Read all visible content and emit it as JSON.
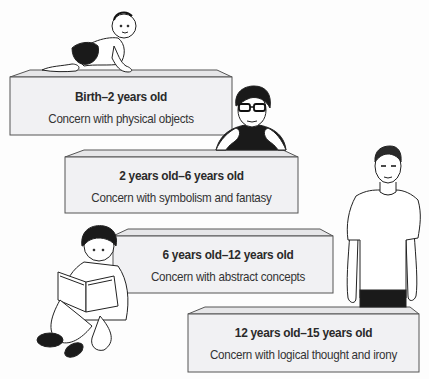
{
  "diagram": {
    "type": "developmental-stages-staircase",
    "colors": {
      "box_fill": "#f1f1f3",
      "box_top": "#e4e4e6",
      "outline": "#555555",
      "text": "#2a2a2a",
      "figure_dark": "#1a1a1a"
    },
    "stages": [
      {
        "title": "Birth–2 years old",
        "description": "Concern with physical objects",
        "figure": "crawling-baby"
      },
      {
        "title": "2 years old–6 years old",
        "description": "Concern with symbolism and fantasy",
        "figure": "child-with-glasses-leaning"
      },
      {
        "title": "6 years old–12 years old",
        "description": "Concern with abstract concepts",
        "figure": "boy-reading-book"
      },
      {
        "title": "12 years old–15 years old",
        "description": "Concern with logical thought and irony",
        "figure": "standing-teenager"
      }
    ]
  }
}
